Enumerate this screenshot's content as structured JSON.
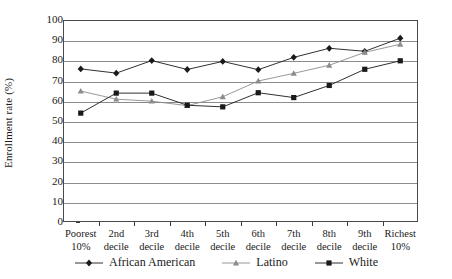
{
  "chart_data": {
    "type": "line",
    "title": "",
    "xlabel": "",
    "ylabel": "Enrollment rate (%)",
    "ylim": [
      0,
      100
    ],
    "ytick_step": 10,
    "yticks": [
      100,
      90,
      80,
      70,
      60,
      50,
      40,
      30,
      20,
      10,
      0
    ],
    "grid": true,
    "legend_position": "bottom",
    "categories": [
      "Poorest 10%",
      "2nd decile",
      "3rd decile",
      "4th decile",
      "5th decile",
      "6th decile",
      "7th decile",
      "8th decile",
      "9th decile",
      "Richest 10%"
    ],
    "category_lines": [
      [
        "Poorest",
        "10%"
      ],
      [
        "2nd",
        "decile"
      ],
      [
        "3rd",
        "decile"
      ],
      [
        "4th",
        "decile"
      ],
      [
        "5th",
        "decile"
      ],
      [
        "6th",
        "decile"
      ],
      [
        "7th",
        "decile"
      ],
      [
        "8th",
        "decile"
      ],
      [
        "9th",
        "decile"
      ],
      [
        "Richest",
        "10%"
      ]
    ],
    "series": [
      {
        "name": "African American",
        "marker": "diamond",
        "color": "#1a1a1a",
        "values": [
          75.8,
          73.7,
          79.9,
          75.5,
          79.5,
          75.4,
          81.5,
          86.0,
          84.5,
          91.0
        ]
      },
      {
        "name": "Latino",
        "marker": "triangle",
        "color": "#8c8c8c",
        "values": [
          64.8,
          60.8,
          59.8,
          57.6,
          62.0,
          69.8,
          73.6,
          77.6,
          84.0,
          88.0
        ]
      },
      {
        "name": "White",
        "marker": "square",
        "color": "#1a1a1a",
        "values": [
          53.9,
          63.8,
          63.8,
          57.8,
          57.0,
          64.0,
          61.6,
          67.6,
          75.6,
          79.8
        ]
      }
    ]
  },
  "legend": {
    "items": [
      {
        "label": "African American"
      },
      {
        "label": "Latino"
      },
      {
        "label": "White"
      }
    ]
  }
}
